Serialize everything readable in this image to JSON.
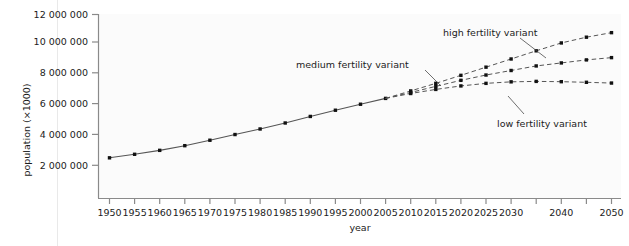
{
  "chart_data": {
    "type": "line",
    "title": "",
    "xlabel": "year",
    "ylabel": "population (×1000)",
    "xlim": [
      1950,
      2050
    ],
    "ylim": [
      0,
      12000000
    ],
    "grid": false,
    "legend_position": "inline-annotations",
    "ytick_labels": [
      "2 000 000",
      "4 000 000",
      "6 000 000",
      "8 000 000",
      "10 000 000",
      "12 000 000"
    ],
    "ytick_values": [
      2000000,
      4000000,
      6000000,
      8000000,
      10000000,
      12000000
    ],
    "xtick_values": [
      1950,
      1955,
      1960,
      1965,
      1970,
      1975,
      1980,
      1985,
      1990,
      1995,
      2000,
      2005,
      2010,
      2015,
      2020,
      2025,
      2030,
      2035,
      2040,
      2045,
      2050
    ],
    "xtick_labels": [
      "1950",
      "1955",
      "1960",
      "1965",
      "1970",
      "1975",
      "1980",
      "1985",
      "1990",
      "1995",
      "2000",
      "2005",
      "2010",
      "2015",
      "2020",
      "2025",
      "2030",
      "",
      "2040",
      "",
      "2050"
    ],
    "series": [
      {
        "name": "historical",
        "style": "solid",
        "x": [
          1950,
          1955,
          1960,
          1965,
          1970,
          1975,
          1980,
          1985,
          1990,
          1995,
          2000,
          2005
        ],
        "values": [
          2529000,
          2763000,
          3023000,
          3332000,
          3691000,
          4068000,
          4435000,
          4831000,
          5264000,
          5674000,
          6071000,
          6456000
        ]
      },
      {
        "name": "high fertility variant",
        "style": "dashed",
        "x": [
          2005,
          2010,
          2015,
          2020,
          2025,
          2030,
          2035,
          2040,
          2045,
          2050
        ],
        "values": [
          6456000,
          6950000,
          7450000,
          7980000,
          8520000,
          9060000,
          9600000,
          10120000,
          10500000,
          10800000
        ]
      },
      {
        "name": "medium fertility variant",
        "style": "dashed",
        "x": [
          2005,
          2010,
          2015,
          2020,
          2025,
          2030,
          2035,
          2040,
          2045,
          2050
        ],
        "values": [
          6456000,
          6850000,
          7250000,
          7650000,
          8000000,
          8300000,
          8600000,
          8800000,
          9000000,
          9150000
        ]
      },
      {
        "name": "low fertility variant",
        "style": "dashed",
        "x": [
          2005,
          2010,
          2015,
          2020,
          2025,
          2030,
          2035,
          2040,
          2045,
          2050
        ],
        "values": [
          6456000,
          6780000,
          7050000,
          7280000,
          7450000,
          7550000,
          7580000,
          7560000,
          7520000,
          7470000
        ]
      }
    ],
    "annotations": [
      {
        "label": "high fertility variant",
        "target_x": 2040,
        "target_y": 10120000
      },
      {
        "label": "medium fertility variant",
        "target_x": 2025,
        "target_y": 8000000
      },
      {
        "label": "low fertility variant",
        "target_x": 2030,
        "target_y": 7550000
      }
    ],
    "colors": {
      "line": "#555555",
      "marker": "#111111",
      "axis": "#8a8a8a",
      "text": "#1b1b1b",
      "plot_background": "#fbfbfb"
    }
  }
}
